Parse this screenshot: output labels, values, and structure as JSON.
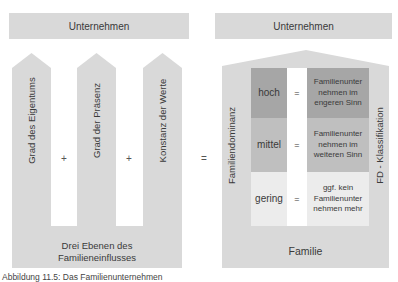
{
  "left": {
    "top_box": "Unternehmen",
    "pillars": [
      {
        "label": "Grad des Eigentums"
      },
      {
        "label": "Grad der Präsenz"
      },
      {
        "label": "Konstanz der Werte"
      }
    ],
    "operators": [
      "+",
      "+"
    ],
    "base_line1": "Drei Ebenen des",
    "base_line2": "Familieneinflusses"
  },
  "equals": "=",
  "right": {
    "top_box": "Unternehmen",
    "side_left": "Familiendominanz",
    "side_right": "FD - Klassifikation",
    "rows": [
      {
        "level": "hoch",
        "op": "=",
        "line1": "Familienunter",
        "line2": "nehmen im",
        "line3": "engeren Sinn",
        "color": "#a6a6a6"
      },
      {
        "level": "mittel",
        "op": "=",
        "line1": "Familienunter",
        "line2": "nehmen im",
        "line3": "weiteren Sinn",
        "color": "#bfbfbf"
      },
      {
        "level": "gering",
        "op": "=",
        "line1": "ggf. kein",
        "line2": "Familienunter",
        "line3": "nehmen mehr",
        "color": "#ececec"
      }
    ],
    "base": "Familie"
  },
  "caption": "Abbildung 11.5: Das Familienunternehmen"
}
